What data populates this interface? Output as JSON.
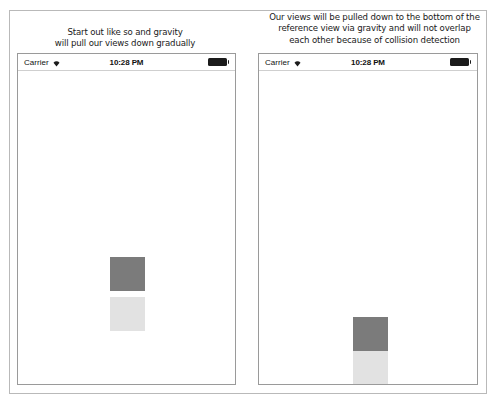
{
  "page": {
    "background": "#ffffff",
    "border_color": "#b9b9b9"
  },
  "panels": [
    {
      "id": "left",
      "caption": {
        "lines": [
          "Start out like so and gravity",
          "will pull our views down gradually"
        ]
      },
      "phone": {
        "status_bar": {
          "carrier": "Carrier",
          "wifi_icon": "wifi-icon",
          "time": "10:28 PM",
          "battery_icon": "battery-full-icon"
        },
        "blocks": [
          {
            "name": "dark-square",
            "color": "#7b7b7b"
          },
          {
            "name": "light-square",
            "color": "#e2e2e2"
          }
        ]
      }
    },
    {
      "id": "right",
      "caption": {
        "lines": [
          "Our views will be pulled down to the bottom of the",
          "reference view via gravity and will not overlap",
          "each other because of collision detection"
        ]
      },
      "phone": {
        "status_bar": {
          "carrier": "Carrier",
          "wifi_icon": "wifi-icon",
          "time": "10:28 PM",
          "battery_icon": "battery-full-icon"
        },
        "blocks": [
          {
            "name": "dark-square",
            "color": "#7b7b7b"
          },
          {
            "name": "light-square",
            "color": "#e2e2e2"
          }
        ]
      }
    }
  ]
}
